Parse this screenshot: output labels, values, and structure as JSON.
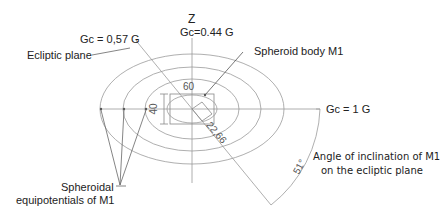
{
  "diagram": {
    "axis_z_label": "Z",
    "gc_top": "Gc=0.44 G",
    "gc_left": "Gc = 0,57 G",
    "gc_right": "Gc = 1 G",
    "ecliptic_plane": "Ecliptic plane",
    "spheroid_body": "Spheroid body M1",
    "equipotentials_line1": "Spheroidal",
    "equipotentials_line2": "equipotentials of  M1",
    "angle_line1": "Angle of inclination of M1",
    "angle_line2": "on the ecliptic plane",
    "dim_width": "60",
    "dim_height": "40",
    "dim_diag": "22,66",
    "angle_value": "51°"
  }
}
